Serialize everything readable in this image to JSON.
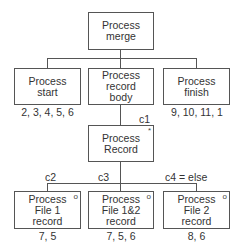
{
  "diagram": {
    "root": {
      "label": "Process\nmerge"
    },
    "level1": [
      {
        "label": "Process\nstart",
        "ops": "2, 3, 4, 5, 6"
      },
      {
        "label": "Process\nrecord\nbody",
        "ops": ""
      },
      {
        "label": "Process\nfinish",
        "ops": "9, 10, 11, 1"
      }
    ],
    "iteration": {
      "label": "Process\nRecord",
      "marker": "*",
      "condition": "c1"
    },
    "selections": [
      {
        "label": "Process\nFile 1\nrecord",
        "marker": "o",
        "condition": "c2",
        "ops": "7, 5"
      },
      {
        "label": "Process\nFile 1&2\nrecord",
        "marker": "o",
        "condition": "c3",
        "ops": "7, 5, 6"
      },
      {
        "label": "Process\nFile 2\nrecord",
        "marker": "o",
        "condition": "c4 = else",
        "ops": "8, 6"
      }
    ]
  }
}
